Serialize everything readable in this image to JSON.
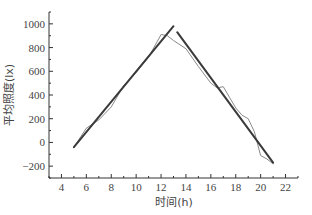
{
  "chart_data": {
    "type": "line",
    "title": "",
    "xlabel": "时间(h)",
    "ylabel": "平均照度(lx)",
    "xlim": [
      3,
      23
    ],
    "ylim": [
      -300,
      1100
    ],
    "xticks": [
      4,
      6,
      8,
      10,
      12,
      14,
      16,
      18,
      20,
      22
    ],
    "yticks": [
      -200,
      0,
      200,
      400,
      600,
      800,
      1000
    ],
    "grid": false,
    "legend": null,
    "series": [
      {
        "name": "measured",
        "style": "thin-gray",
        "x": [
          5,
          6,
          7,
          8,
          9,
          10,
          11,
          12,
          12.5,
          13,
          14,
          15,
          16,
          16.5,
          17,
          17.5,
          18,
          18.5,
          19,
          19.5,
          20,
          20.5,
          21
        ],
        "y": [
          -40,
          120,
          190,
          300,
          480,
          590,
          720,
          910,
          900,
          860,
          790,
          640,
          500,
          460,
          470,
          380,
          290,
          230,
          200,
          90,
          -110,
          -140,
          -180
        ]
      },
      {
        "name": "linear fit (rising)",
        "style": "thick-dark",
        "x": [
          5,
          13
        ],
        "y": [
          -40,
          980
        ]
      },
      {
        "name": "linear fit (falling)",
        "style": "thick-dark",
        "x": [
          13.3,
          21
        ],
        "y": [
          930,
          -170
        ]
      }
    ]
  }
}
